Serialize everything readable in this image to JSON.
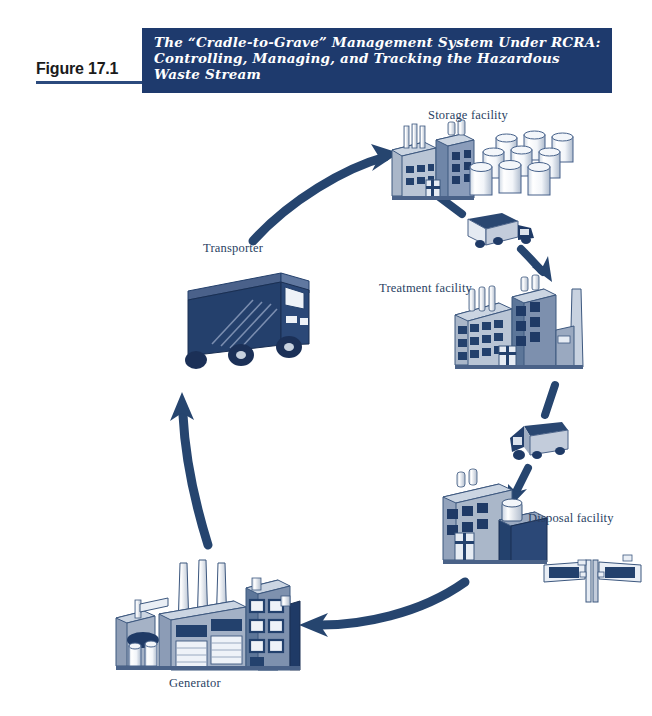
{
  "figure": {
    "number_label": "Figure 17.1",
    "title": "The “Cradle-to-Grave” Management System Under RCRA:\nControlling, Managing, and Tracking the Hazardous\nWaste Stream",
    "banner_color": "#1e3a6d",
    "accent_color": "#2b4a7d",
    "icon_dark": "#1f3a66",
    "icon_mid": "#44618f",
    "icon_light": "#b8c4d4",
    "icon_pale": "#e8edf4"
  },
  "diagram": {
    "type": "cycle-flow",
    "nodes": [
      {
        "id": "storage",
        "label": "Storage facility",
        "icon": "storage-facility-icon",
        "x": 428,
        "y": 108
      },
      {
        "id": "transporter",
        "label": "Transporter",
        "icon": "transport-truck-icon",
        "x": 203,
        "y": 241
      },
      {
        "id": "treatment",
        "label": "Treatment facility",
        "icon": "treatment-facility-icon",
        "x": 379,
        "y": 281
      },
      {
        "id": "disposal",
        "label": "Disposal facility",
        "icon": "disposal-facility-icon",
        "x": 528,
        "y": 511
      },
      {
        "id": "generator",
        "label": "Generator",
        "icon": "generator-plant-icon",
        "x": 169,
        "y": 676
      }
    ],
    "edges": [
      {
        "from": "transporter",
        "to": "storage",
        "style": "curved-arrow",
        "name": "arrow-transporter-to-storage"
      },
      {
        "from": "storage",
        "to": "treatment",
        "style": "truck-arrow",
        "name": "arrow-storage-to-treatment"
      },
      {
        "from": "treatment",
        "to": "disposal",
        "style": "truck-arrow",
        "name": "arrow-treatment-to-disposal"
      },
      {
        "from": "disposal",
        "to": "generator",
        "style": "curved-arrow",
        "name": "arrow-disposal-to-generator"
      },
      {
        "from": "generator",
        "to": "transporter",
        "style": "curved-arrow",
        "name": "arrow-generator-to-transporter"
      }
    ]
  }
}
